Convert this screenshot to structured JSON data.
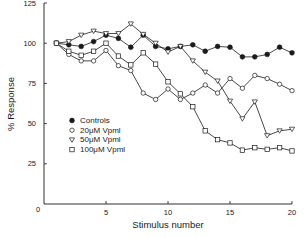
{
  "chart_data": {
    "type": "line",
    "title": "",
    "xlabel": "Stimulus number",
    "ylabel": "% Response",
    "xlim": [
      0,
      20
    ],
    "ylim": [
      0,
      125
    ],
    "xticks": [
      0,
      5,
      10,
      15,
      20
    ],
    "yticks": [
      0,
      25,
      50,
      75,
      100,
      125
    ],
    "xtick_labels": [
      "0",
      "5",
      "10",
      "15",
      "20"
    ],
    "ytick_labels": [
      "0",
      "25",
      "50",
      "75",
      "100",
      "125"
    ],
    "grid": false,
    "legend_position": "center-left",
    "x": [
      1,
      2,
      3,
      4,
      5,
      6,
      7,
      8,
      9,
      10,
      11,
      12,
      13,
      14,
      15,
      16,
      17,
      18,
      19,
      20
    ],
    "series": [
      {
        "name": "Controls",
        "marker": "filled-circle",
        "values": [
          100,
          99,
          98,
          101,
          105,
          103,
          97.5,
          105,
          98,
          96.5,
          98,
          99,
          95,
          98,
          97.5,
          91.5,
          91.5,
          93,
          97.5,
          94
        ]
      },
      {
        "name": "20μM Vpml",
        "marker": "open-circle",
        "values": [
          100,
          93,
          89,
          89,
          95.5,
          86,
          83,
          69,
          65,
          71.5,
          65,
          69,
          74,
          69,
          78,
          72,
          80,
          78,
          74.5,
          70.5
        ]
      },
      {
        "name": "50μM Vpml",
        "marker": "open-triangle-down",
        "values": [
          100,
          101,
          105,
          107.5,
          106,
          106,
          112,
          105.5,
          100,
          94.5,
          98,
          89,
          82,
          76.5,
          64,
          53,
          63.5,
          42.5,
          45.5,
          46.5
        ]
      },
      {
        "name": "100μM Vpml",
        "marker": "open-square",
        "values": [
          100,
          95,
          92.5,
          95,
          100,
          92,
          86.5,
          94,
          87,
          76,
          68.5,
          60.5,
          45.5,
          40,
          38,
          33.5,
          35,
          34,
          35,
          33
        ]
      }
    ]
  },
  "colors": {
    "ink": "#1a1a1a",
    "background": "#ffffff"
  }
}
